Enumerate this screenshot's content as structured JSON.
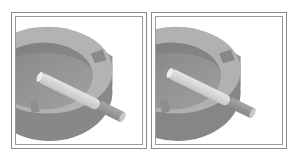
{
  "figure": {
    "panels": [
      {
        "id": "left",
        "subject": "ashtray with cigarette",
        "colors": {
          "background": "#ffffff",
          "ashtray_outer": "#8c8c8c",
          "ashtray_rim_top": "#b4b4b4",
          "ashtray_bowl": "#8e8e8e",
          "ashtray_bowl_floor": "#9c9c9c",
          "cigarette_paper": "#d6d6d6",
          "cigarette_filter": "#9a9a9a"
        }
      },
      {
        "id": "right",
        "subject": "ashtray with cigarette",
        "colors": {
          "background": "#ffffff",
          "ashtray_outer": "#8a8a8a",
          "ashtray_rim_top": "#b2b2b2",
          "ashtray_bowl": "#8c8c8c",
          "ashtray_bowl_floor": "#9a9a9a",
          "cigarette_paper": "#d8d8d8",
          "cigarette_filter": "#989898"
        }
      }
    ],
    "frame_color": "#8a8a8a"
  }
}
